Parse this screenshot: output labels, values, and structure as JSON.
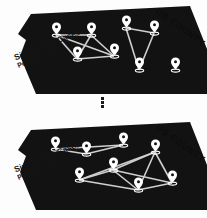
{
  "figure": {
    "background_color": "#ffffff",
    "panel_fill": "#121212",
    "node_color": "#ffffff",
    "edge_color": "#cfcfcf",
    "text_color": "#141414",
    "ellipsis_glyph": "vertical-ellipsis"
  },
  "panels": [
    {
      "id": "period-1",
      "county_label": "US COUNTY",
      "side_label_line1": "Similar NewCases",
      "side_label_line2_prefix": "Period ",
      "side_label_t_from": "T",
      "side_label_t_from_sub": "1",
      "side_label_vs": " vs ",
      "side_label_t_to": "T",
      "side_label_t_to_sub": "2",
      "side_label_full": "Similar NewCases Period T1 vs T2",
      "nodes": [
        {
          "id": "n1",
          "x": 56,
          "y": 41
        },
        {
          "id": "n2",
          "x": 91,
          "y": 41
        },
        {
          "id": "n3",
          "x": 77,
          "y": 65
        },
        {
          "id": "n4",
          "x": 114,
          "y": 62
        },
        {
          "id": "n5",
          "x": 126,
          "y": 34
        },
        {
          "id": "n6",
          "x": 154,
          "y": 39
        },
        {
          "id": "n7",
          "x": 139,
          "y": 76
        },
        {
          "id": "n8",
          "x": 175,
          "y": 76
        }
      ],
      "edges": [
        [
          "n1",
          "n2"
        ],
        [
          "n1",
          "n3"
        ],
        [
          "n1",
          "n4"
        ],
        [
          "n2",
          "n3"
        ],
        [
          "n2",
          "n4"
        ],
        [
          "n3",
          "n4"
        ],
        [
          "n5",
          "n6"
        ],
        [
          "n5",
          "n7"
        ],
        [
          "n6",
          "n7"
        ]
      ],
      "isolated_nodes": [
        "n8"
      ]
    },
    {
      "id": "period-k",
      "county_label": "US COUNTY",
      "side_label_line1": "Similar NewCases",
      "side_label_line2_prefix": "Period ",
      "side_label_t_from": "T",
      "side_label_t_from_sub": "k",
      "side_label_vs": " vs ",
      "side_label_t_to": "T",
      "side_label_t_to_sub": "k+1",
      "side_label_full": "Similar NewCases Period Tk vs Tk+1",
      "nodes": [
        {
          "id": "m1",
          "x": 55,
          "y": 37
        },
        {
          "id": "m2",
          "x": 86,
          "y": 42
        },
        {
          "id": "m3",
          "x": 123,
          "y": 33
        },
        {
          "id": "m4",
          "x": 155,
          "y": 40
        },
        {
          "id": "m5",
          "x": 113,
          "y": 58
        },
        {
          "id": "m6",
          "x": 79,
          "y": 68
        },
        {
          "id": "m7",
          "x": 138,
          "y": 78
        },
        {
          "id": "m8",
          "x": 172,
          "y": 71
        }
      ],
      "edges": [
        [
          "m1",
          "m2"
        ],
        [
          "m1",
          "m3"
        ],
        [
          "m2",
          "m3"
        ],
        [
          "m4",
          "m5"
        ],
        [
          "m4",
          "m6"
        ],
        [
          "m4",
          "m7"
        ],
        [
          "m4",
          "m8"
        ],
        [
          "m5",
          "m6"
        ],
        [
          "m5",
          "m7"
        ],
        [
          "m5",
          "m8"
        ],
        [
          "m6",
          "m7"
        ],
        [
          "m7",
          "m8"
        ]
      ],
      "isolated_nodes": []
    }
  ]
}
